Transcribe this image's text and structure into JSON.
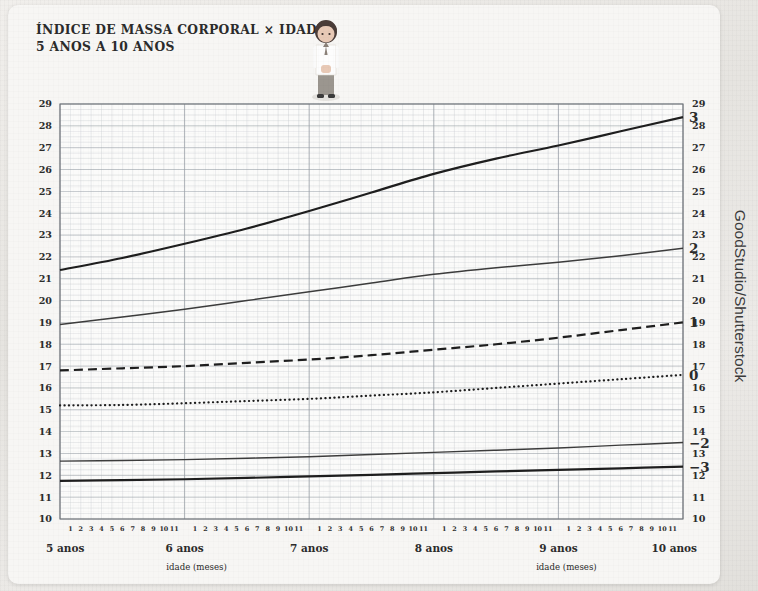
{
  "card": {
    "title_line1": "ÍNDICE DE MASSA CORPORAL × IDADE",
    "title_line2": "5 ANOS A 10 ANOS",
    "illustration": "child-standing-illustration"
  },
  "credit": {
    "text": "GoodStudio/Shutterstock"
  },
  "axis": {
    "x_title_left": "idade (meses)",
    "x_title_right": "idade (meses)",
    "year_labels": [
      "5 anos",
      "6 anos",
      "7 anos",
      "8 anos",
      "9 anos",
      "10 anos"
    ],
    "month_labels": [
      "1",
      "2",
      "3",
      "4",
      "5",
      "6",
      "7",
      "8",
      "9",
      "10",
      "11"
    ],
    "y_labels": [
      "10",
      "11",
      "12",
      "13",
      "14",
      "15",
      "16",
      "17",
      "18",
      "19",
      "20",
      "21",
      "22",
      "23",
      "24",
      "25",
      "26",
      "27",
      "28",
      "29"
    ]
  },
  "colors": {
    "ink": "#2b2b2b",
    "curve_strong": "#1e1e1e",
    "curve_mid": "#3c3c3c",
    "grid_major": "#9aa0a8",
    "grid_minor": "#c9ccd1",
    "frame": "#6f7479",
    "paper": "#f7f6f4"
  },
  "chart_data": {
    "type": "line",
    "xlabel": "idade (meses)",
    "ylabel": "IMC (kg/m²)",
    "xlim": [
      5,
      10
    ],
    "ylim": [
      10,
      29
    ],
    "grid": true,
    "legend_position": "right-inline",
    "x_unit": "anos",
    "x": [
      5,
      5.5,
      6,
      6.5,
      7,
      7.5,
      8,
      8.5,
      9,
      9.5,
      10
    ],
    "x_tick_labels": [
      "5 anos",
      "6 anos",
      "7 anos",
      "8 anos",
      "9 anos",
      "10 anos"
    ],
    "series": [
      {
        "name": "3",
        "label": "3",
        "style": "solid",
        "width": 2.2,
        "values": [
          21.4,
          21.95,
          22.6,
          23.3,
          24.1,
          24.95,
          25.8,
          26.5,
          27.1,
          27.75,
          28.4
        ]
      },
      {
        "name": "2",
        "label": "2",
        "style": "solid",
        "width": 1.5,
        "values": [
          18.9,
          19.25,
          19.6,
          20.0,
          20.4,
          20.8,
          21.2,
          21.5,
          21.75,
          22.05,
          22.4
        ]
      },
      {
        "name": "1",
        "label": "1",
        "style": "dashed",
        "width": 2.2,
        "values": [
          16.8,
          16.9,
          17.0,
          17.15,
          17.3,
          17.5,
          17.75,
          18.0,
          18.3,
          18.65,
          19.0
        ]
      },
      {
        "name": "0",
        "label": "0",
        "style": "dotted",
        "width": 2.2,
        "values": [
          15.2,
          15.22,
          15.3,
          15.4,
          15.5,
          15.65,
          15.8,
          16.0,
          16.2,
          16.4,
          16.6
        ]
      },
      {
        "name": "-2",
        "label": "−2",
        "style": "solid",
        "width": 1.4,
        "values": [
          12.65,
          12.68,
          12.72,
          12.78,
          12.85,
          12.95,
          13.05,
          13.15,
          13.25,
          13.38,
          13.5
        ]
      },
      {
        "name": "-3",
        "label": "−3",
        "style": "solid",
        "width": 2.2,
        "values": [
          11.75,
          11.78,
          11.82,
          11.88,
          11.95,
          12.02,
          12.1,
          12.18,
          12.25,
          12.32,
          12.4
        ]
      }
    ]
  }
}
